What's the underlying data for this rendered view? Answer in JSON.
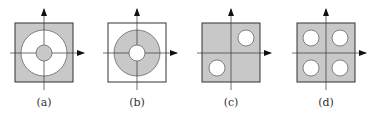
{
  "figure": {
    "colors": {
      "shade": "#c8c8c8",
      "stroke": "#333333",
      "background": "#ffffff"
    },
    "panels": [
      {
        "id": "a",
        "label": "(a)",
        "description": "shaded square with white annulus and shaded central disk"
      },
      {
        "id": "b",
        "label": "(b)",
        "description": "white square with shaded annulus and white central hole"
      },
      {
        "id": "c",
        "label": "(c)",
        "description": "shaded square with white holes in first and third quadrants"
      },
      {
        "id": "d",
        "label": "(d)",
        "description": "shaded square with white holes in all four quadrants"
      }
    ]
  }
}
